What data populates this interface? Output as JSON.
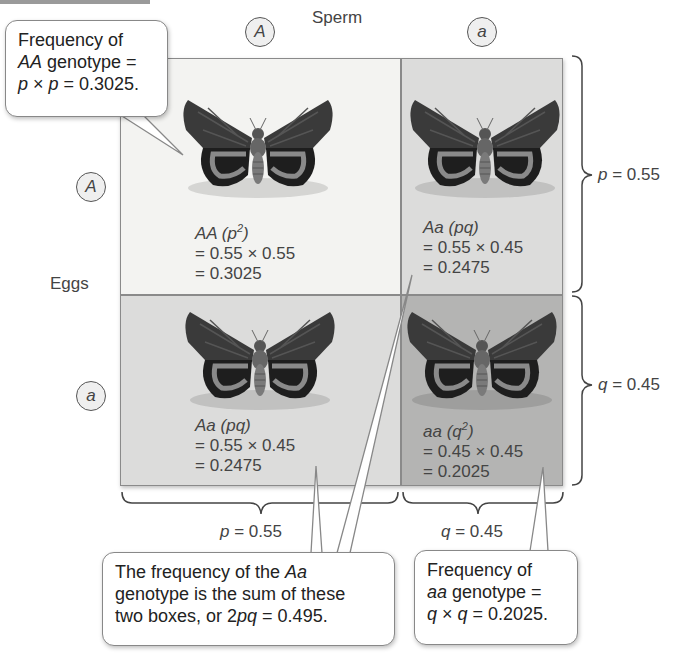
{
  "header": {
    "sperm_label": "Sperm",
    "eggs_label": "Eggs",
    "sperm_alleles": [
      "A",
      "a"
    ],
    "egg_alleles": [
      "A",
      "a"
    ]
  },
  "cells": [
    {
      "genotype": "AA",
      "formula_suffix": " (p",
      "sup": "2",
      "formula_end": ")",
      "calc": "= 0.55 × 0.55",
      "result": "= 0.3025",
      "color": "#f3f3f1"
    },
    {
      "genotype": "Aa",
      "formula_suffix": " (pq)",
      "sup": "",
      "formula_end": "",
      "calc": "= 0.55 × 0.45",
      "result": "= 0.2475",
      "color": "#dcdcdb"
    },
    {
      "genotype": "Aa",
      "formula_suffix": " (pq)",
      "sup": "",
      "formula_end": "",
      "calc": "= 0.55 × 0.45",
      "result": "= 0.2475",
      "color": "#dcdcdb"
    },
    {
      "genotype": "aa",
      "formula_suffix": " (q",
      "sup": "2",
      "formula_end": ")",
      "calc": "= 0.45 × 0.45",
      "result": "= 0.2025",
      "color": "#b4b4b3"
    }
  ],
  "braces": {
    "right_top": {
      "var": "p",
      "text": " = 0.55"
    },
    "right_bottom": {
      "var": "q",
      "text": " = 0.45"
    },
    "bottom_left": {
      "var": "p",
      "text": " = 0.55"
    },
    "bottom_right": {
      "var": "q",
      "text": " = 0.45"
    }
  },
  "callouts": {
    "top_left": {
      "line1": "Frequency of",
      "line2_italic": "AA",
      "line2_rest": " genotype =",
      "line3_a": "p",
      "line3_b": " × ",
      "line3_c": "p",
      "line3_d": " = 0.3025."
    },
    "bottom_middle": {
      "line1_text": "The frequency of the ",
      "line1_italic": "Aa",
      "line2": "genotype is the sum of these",
      "line3_text": "two boxes, or 2",
      "line3_italic": "pq",
      "line3_end": " = 0.495."
    },
    "bottom_right": {
      "line1": "Frequency of",
      "line2_italic": "aa",
      "line2_rest": " genotype =",
      "line3_a": "q",
      "line3_b": " × ",
      "line3_c": "q",
      "line3_d": " = 0.2025."
    }
  },
  "icons": {
    "moth": "moth-illustration"
  }
}
